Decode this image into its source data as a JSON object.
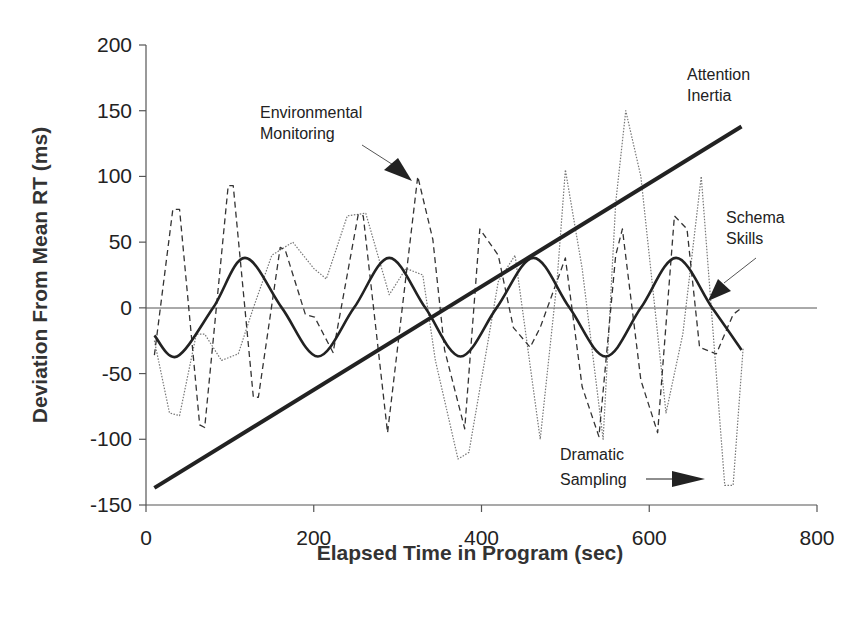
{
  "chart_data": {
    "type": "line",
    "title": "",
    "xlabel": "Elapsed Time in Program (sec)",
    "ylabel": "Deviation From Mean RT (ms)",
    "xlim": [
      0,
      800
    ],
    "ylim": [
      -150,
      200
    ],
    "xticks": [
      0,
      200,
      400,
      600,
      800
    ],
    "yticks": [
      -150,
      -100,
      -50,
      0,
      50,
      100,
      150,
      200
    ],
    "grid": false,
    "zero_line": true,
    "legend": "none (inline annotations)",
    "series": [
      {
        "name": "Attention Inertia",
        "style": "solid-thick",
        "x": [
          10,
          710
        ],
        "y": [
          -137,
          138
        ]
      },
      {
        "name": "Schema Skills",
        "style": "solid",
        "x": [
          10,
          37,
          80,
          118,
          162,
          205,
          248,
          290,
          333,
          375,
          418,
          462,
          505,
          548,
          590,
          632,
          675,
          710
        ],
        "y": [
          -21,
          -37,
          0,
          38,
          0,
          -37,
          0,
          38,
          0,
          -37,
          0,
          38,
          0,
          -37,
          0,
          38,
          0,
          -32
        ]
      },
      {
        "name": "Environmental Monitoring",
        "style": "dashed",
        "x": [
          10,
          32,
          40,
          64,
          70,
          98,
          104,
          128,
          134,
          160,
          166,
          190,
          201,
          223,
          253,
          259,
          288,
          324,
          342,
          356,
          380,
          398,
          420,
          438,
          458,
          470,
          500,
          520,
          540,
          560,
          568,
          590,
          610,
          630,
          645,
          660,
          680,
          700,
          710
        ],
        "y": [
          -36,
          75,
          75,
          -89,
          -91,
          93,
          93,
          -68,
          -68,
          46,
          44,
          -5,
          -7,
          -34,
          71,
          70,
          -95,
          100,
          52,
          -32,
          -92,
          60,
          40,
          -15,
          -30,
          -15,
          38,
          -60,
          -98,
          40,
          60,
          -55,
          -95,
          70,
          60,
          -30,
          -35,
          -5,
          0
        ]
      },
      {
        "name": "Dramatic Sampling",
        "style": "dotted",
        "x": [
          10,
          28,
          40,
          60,
          70,
          90,
          110,
          128,
          150,
          175,
          200,
          215,
          240,
          262,
          290,
          310,
          330,
          345,
          372,
          385,
          420,
          440,
          470,
          490,
          500,
          520,
          545,
          560,
          572,
          590,
          620,
          640,
          662,
          690,
          700,
          712
        ],
        "y": [
          -25,
          -80,
          -82,
          -20,
          -20,
          -40,
          -35,
          0,
          40,
          50,
          30,
          22,
          70,
          72,
          10,
          30,
          25,
          -40,
          -115,
          -110,
          20,
          40,
          -100,
          20,
          105,
          30,
          -100,
          80,
          150,
          100,
          -80,
          -20,
          100,
          -135,
          -135,
          -30
        ]
      }
    ],
    "annotations": [
      {
        "text": [
          "Attention",
          "Inertia"
        ],
        "target": "Attention Inertia"
      },
      {
        "text": [
          "Environmental",
          "Monitoring"
        ],
        "target": "Environmental Monitoring",
        "arrow": true
      },
      {
        "text": [
          "Schema",
          "Skills"
        ],
        "target": "Schema Skills",
        "arrow": true
      },
      {
        "text": [
          "Dramatic",
          "Sampling"
        ],
        "target": "Dramatic Sampling",
        "arrow": true
      }
    ]
  },
  "labels": {
    "xlabel": "Elapsed Time in Program (sec)",
    "ylabel": "Deviation From Mean RT (ms)",
    "ann_attention_1": "Attention",
    "ann_attention_2": "Inertia",
    "ann_env_1": "Environmental",
    "ann_env_2": "Monitoring",
    "ann_schema_1": "Schema",
    "ann_schema_2": "Skills",
    "ann_dramatic_1": "Dramatic",
    "ann_dramatic_2": "Sampling",
    "xticks": [
      "0",
      "200",
      "400",
      "600",
      "800"
    ],
    "yticks": [
      "200",
      "150",
      "100",
      "50",
      "0",
      "-50",
      "-100",
      "-150"
    ]
  }
}
